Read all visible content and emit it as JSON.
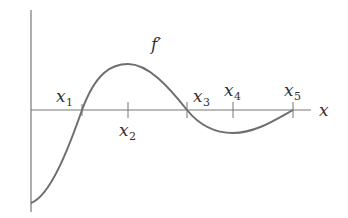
{
  "diagram": {
    "curve_label": "f′",
    "x_axis_label": "x",
    "points": [
      {
        "name": "x1",
        "base": "x",
        "sub": "1",
        "description": "zero of f', f' changes from negative to positive"
      },
      {
        "name": "x2",
        "base": "x",
        "sub": "2",
        "description": "local maximum of f'"
      },
      {
        "name": "x3",
        "base": "x",
        "sub": "3",
        "description": "zero of f', f' changes from positive to negative"
      },
      {
        "name": "x4",
        "base": "x",
        "sub": "4",
        "description": "local minimum of f'"
      },
      {
        "name": "x5",
        "base": "x",
        "sub": "5",
        "description": "zero of f'"
      }
    ],
    "colors": {
      "axis": "#666666",
      "curve": "#6e6e6e",
      "text": "#333333",
      "background": "#ffffff"
    }
  }
}
